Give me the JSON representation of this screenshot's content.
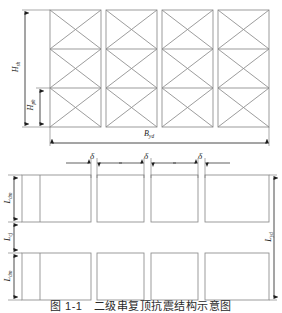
{
  "figure": {
    "caption": "图 1-1　二级串复顶抗震结构示意图",
    "caption_visible_fragment": "二级串复顶抗震结构示意图"
  },
  "elevation_view": {
    "name": "elevation-view",
    "panel_count": 4,
    "bays_per_panel": 3,
    "bracing": "double-diagonal-X",
    "dimensions": [
      {
        "id": "H_sh",
        "base": "H",
        "sub": "sh",
        "orientation": "vertical",
        "side": "left",
        "spans": "full-height"
      },
      {
        "id": "H_ph",
        "base": "H",
        "sub": "ph",
        "orientation": "vertical",
        "side": "left-inner",
        "spans": "one-bay"
      },
      {
        "id": "B_yd",
        "base": "B",
        "sub": "yd",
        "orientation": "horizontal",
        "side": "bottom",
        "spans": "full-width"
      }
    ]
  },
  "plan_view": {
    "name": "plan-view",
    "rows": 2,
    "modules_per_row": 4,
    "gap_labels": [
      "δ",
      "δ",
      "δ"
    ],
    "dimensions": [
      {
        "id": "L_dm_top",
        "base": "L",
        "sub": "dm",
        "orientation": "vertical",
        "side": "left",
        "spans": "top-row"
      },
      {
        "id": "L_cj",
        "base": "L",
        "sub": "cj",
        "orientation": "vertical",
        "side": "left",
        "spans": "row-gap"
      },
      {
        "id": "L_dm_bottom",
        "base": "L",
        "sub": "dm",
        "orientation": "vertical",
        "side": "left",
        "spans": "bottom-row"
      },
      {
        "id": "L_yd",
        "base": "L",
        "sub": "yd",
        "orientation": "vertical",
        "side": "right",
        "spans": "full-depth"
      }
    ]
  },
  "labels": {
    "H_sh": {
      "base": "H",
      "sub": "sh"
    },
    "H_ph": {
      "base": "H",
      "sub": "ph"
    },
    "B_yd": {
      "base": "B",
      "sub": "yd"
    },
    "L_dm_top": {
      "base": "L",
      "sub": "dm"
    },
    "L_cj": {
      "base": "L",
      "sub": "cj"
    },
    "L_dm_bottom": {
      "base": "L",
      "sub": "dm"
    },
    "L_yd": {
      "base": "L",
      "sub": "yd"
    },
    "delta_1": "δ",
    "delta_2": "δ",
    "delta_3": "δ"
  },
  "colors": {
    "background": "#ffffff",
    "member_line": "#8a8a8a",
    "dimension_line": "#2a2a2a",
    "text": "#1d1d1d"
  }
}
